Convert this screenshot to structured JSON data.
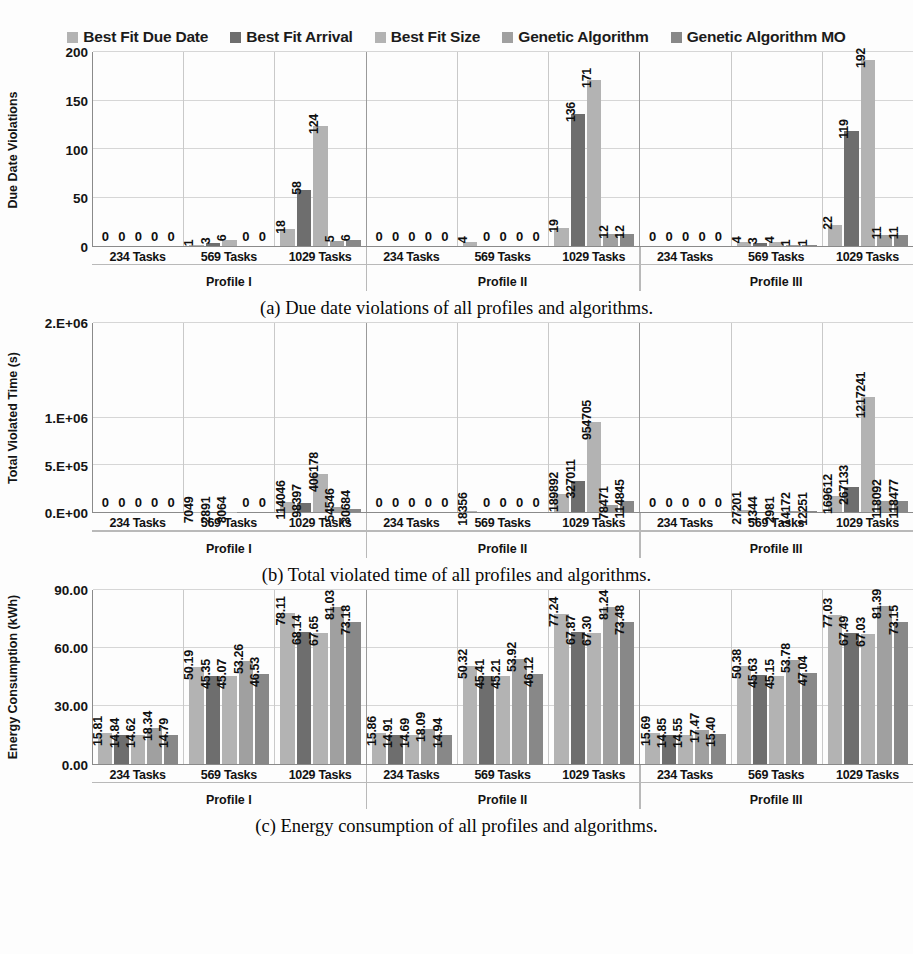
{
  "legend": {
    "items": [
      {
        "label": "Best Fit Due Date",
        "color": "#b3b3b3"
      },
      {
        "label": "Best Fit Arrival",
        "color": "#6e6e6e"
      },
      {
        "label": "Best Fit Size",
        "color": "#b3b3b3"
      },
      {
        "label": "Genetic Algorithm",
        "color": "#a0a0a0"
      },
      {
        "label": "Genetic Algorithm MO",
        "color": "#888888"
      }
    ]
  },
  "axis": {
    "profiles": [
      "Profile I",
      "Profile II",
      "Profile III"
    ],
    "task_groups": [
      "234 Tasks",
      "569 Tasks",
      "1029 Tasks"
    ]
  },
  "captions": {
    "a": "(a) Due date violations of all profiles and algorithms.",
    "b": "(b) Total violated time of all profiles and algorithms.",
    "c": "(c) Energy consumption of all profiles and algorithms."
  },
  "chart_data": [
    {
      "id": "a",
      "type": "bar",
      "title": "",
      "ylabel": "Due Date Violations",
      "xlabel": "",
      "ylim": [
        0,
        200
      ],
      "yticks": [
        0,
        50,
        100,
        150,
        200
      ],
      "ytick_labels": [
        "0",
        "50",
        "100",
        "150",
        "200"
      ],
      "grid": true,
      "legend_position": "top",
      "categories": [
        "Profile I / 234 Tasks",
        "Profile I / 569 Tasks",
        "Profile I / 1029 Tasks",
        "Profile II / 234 Tasks",
        "Profile II / 569 Tasks",
        "Profile II / 1029 Tasks",
        "Profile III / 234 Tasks",
        "Profile III / 569 Tasks",
        "Profile III / 1029 Tasks"
      ],
      "series": [
        {
          "name": "Best Fit Due Date",
          "values": [
            0,
            1,
            18,
            0,
            4,
            19,
            0,
            4,
            22
          ]
        },
        {
          "name": "Best Fit Arrival",
          "values": [
            0,
            3,
            58,
            0,
            0,
            136,
            0,
            3,
            119
          ]
        },
        {
          "name": "Best Fit Size",
          "values": [
            0,
            6,
            124,
            0,
            0,
            171,
            0,
            4,
            192
          ]
        },
        {
          "name": "Genetic Algorithm",
          "values": [
            0,
            0,
            5,
            0,
            0,
            12,
            0,
            1,
            11
          ]
        },
        {
          "name": "Genetic Algorithm MO",
          "values": [
            0,
            0,
            6,
            0,
            0,
            12,
            0,
            1,
            11
          ]
        }
      ]
    },
    {
      "id": "b",
      "type": "bar",
      "title": "",
      "ylabel": "Total Violated Time (s)",
      "xlabel": "",
      "ylim": [
        0,
        2000000
      ],
      "yticks": [
        0,
        500000,
        1000000,
        2000000
      ],
      "ytick_labels": [
        "0.E+00",
        "5.E+05",
        "1.E+06",
        "2.E+06"
      ],
      "grid": true,
      "legend_position": "top",
      "categories": [
        "Profile I / 234 Tasks",
        "Profile I / 569 Tasks",
        "Profile I / 1029 Tasks",
        "Profile II / 234 Tasks",
        "Profile II / 569 Tasks",
        "Profile II / 1029 Tasks",
        "Profile III / 234 Tasks",
        "Profile III / 569 Tasks",
        "Profile III / 1029 Tasks"
      ],
      "series": [
        {
          "name": "Best Fit Due Date",
          "values": [
            0,
            7049,
            114046,
            0,
            18356,
            189892,
            0,
            27201,
            169612
          ]
        },
        {
          "name": "Best Fit Arrival",
          "values": [
            0,
            2891,
            98397,
            0,
            0,
            327011,
            0,
            1344,
            267133
          ]
        },
        {
          "name": "Best Fit Size",
          "values": [
            0,
            8064,
            406178,
            0,
            0,
            954705,
            0,
            2981,
            1217241
          ]
        },
        {
          "name": "Genetic Algorithm",
          "values": [
            0,
            0,
            54546,
            0,
            0,
            78471,
            0,
            14172,
            118092
          ]
        },
        {
          "name": "Genetic Algorithm MO",
          "values": [
            0,
            0,
            30684,
            0,
            0,
            114845,
            0,
            12251,
            118477
          ]
        }
      ]
    },
    {
      "id": "c",
      "type": "bar",
      "title": "",
      "ylabel": "Energy Consumption (kWh)",
      "xlabel": "",
      "ylim": [
        0,
        90
      ],
      "yticks": [
        0,
        30,
        60,
        90
      ],
      "ytick_labels": [
        "0.00",
        "30.00",
        "60.00",
        "90.00"
      ],
      "grid": true,
      "legend_position": "top",
      "categories": [
        "Profile I / 234 Tasks",
        "Profile I / 569 Tasks",
        "Profile I / 1029 Tasks",
        "Profile II / 234 Tasks",
        "Profile II / 569 Tasks",
        "Profile II / 1029 Tasks",
        "Profile III / 234 Tasks",
        "Profile III / 569 Tasks",
        "Profile III / 1029 Tasks"
      ],
      "series": [
        {
          "name": "Best Fit Due Date",
          "values": [
            15.81,
            50.19,
            78.11,
            15.86,
            50.32,
            77.24,
            15.69,
            50.38,
            77.03
          ]
        },
        {
          "name": "Best Fit Arrival",
          "values": [
            14.84,
            45.35,
            68.14,
            14.91,
            45.41,
            67.87,
            14.85,
            45.63,
            67.49
          ]
        },
        {
          "name": "Best Fit Size",
          "values": [
            14.62,
            45.07,
            67.65,
            14.69,
            45.21,
            67.3,
            14.55,
            45.15,
            67.03
          ]
        },
        {
          "name": "Genetic Algorithm",
          "values": [
            18.34,
            53.26,
            81.03,
            18.09,
            53.92,
            81.24,
            17.47,
            53.78,
            81.39
          ]
        },
        {
          "name": "Genetic Algorithm MO",
          "values": [
            14.79,
            46.53,
            73.18,
            14.94,
            46.12,
            73.48,
            15.4,
            47.04,
            73.15
          ]
        }
      ]
    }
  ]
}
